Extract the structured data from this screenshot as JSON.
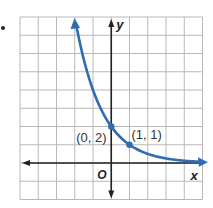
{
  "problem_marker": ".",
  "chart_data": {
    "type": "line",
    "title": "",
    "function": "y = 2(1/2)^x",
    "xlabel": "x",
    "ylabel": "y",
    "origin_label": "O",
    "xlim": [
      -5,
      5
    ],
    "ylim": [
      -2,
      8
    ],
    "grid": true,
    "series": [
      {
        "name": "exponential decay",
        "color": "#2E6DB4",
        "x": [
          -2,
          -1.5,
          -1,
          -0.5,
          0,
          0.5,
          1,
          2,
          3,
          4,
          5
        ],
        "y": [
          8,
          5.66,
          4,
          2.83,
          2,
          1.41,
          1,
          0.5,
          0.25,
          0.125,
          0.0625
        ]
      }
    ],
    "points": [
      {
        "x": 0,
        "y": 2,
        "label": "(0, 2)"
      },
      {
        "x": 1,
        "y": 1,
        "label": "(1, 1)"
      }
    ]
  }
}
